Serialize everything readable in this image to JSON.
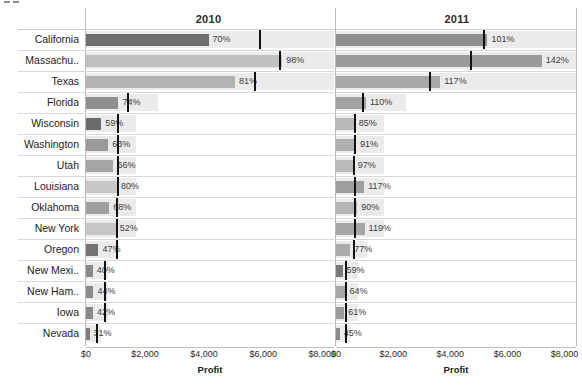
{
  "panels": [
    {
      "label": "2010"
    },
    {
      "label": "2011"
    }
  ],
  "axis": {
    "title": "Profit",
    "ticks": [
      "$0",
      "$2,000",
      "$4,000",
      "$6,000",
      "$8,000"
    ]
  },
  "colors": {
    "band": "#ebebeb",
    "reference_line": "#111111",
    "gridline": "#d8d8d8",
    "label_text": "#1c1c1c",
    "bar_dark": "#6e6e6e",
    "bar_light": "#c4c4c4"
  },
  "chart_data": {
    "type": "bar",
    "title": "",
    "xlabel": "Profit",
    "ylabel": "",
    "xlim": [
      0,
      8400
    ],
    "categories": [
      "California",
      "Massachu..",
      "Texas",
      "Florida",
      "Wisconsin",
      "Washington",
      "Utah",
      "Louisiana",
      "Oklahoma",
      "New York",
      "Oregon",
      "New Mexi..",
      "New Ham..",
      "Iowa",
      "Nevada"
    ],
    "panel_labels": [
      "2010",
      "2011"
    ],
    "series": [
      {
        "name": "2010",
        "values": [
          4150,
          6650,
          5050,
          1100,
          520,
          750,
          930,
          1050,
          790,
          1010,
          420,
          230,
          250,
          240,
          120
        ],
        "labels": [
          "70%",
          "98%",
          "81%",
          "74%",
          "59%",
          "63%",
          "66%",
          "80%",
          "68%",
          "52%",
          "47%",
          "40%",
          "44%",
          "42%",
          "31%"
        ],
        "reference_values": [
          5850,
          6550,
          5700,
          1380,
          1060,
          1060,
          1060,
          1060,
          1010,
          1010,
          1010,
          620,
          620,
          600,
          330
        ]
      },
      {
        "name": "2011",
        "values": [
          5300,
          7200,
          3650,
          1050,
          660,
          700,
          620,
          990,
          740,
          1000,
          500,
          230,
          330,
          290,
          130
        ],
        "labels": [
          "101%",
          "142%",
          "117%",
          "110%",
          "85%",
          "91%",
          "97%",
          "117%",
          "90%",
          "119%",
          "77%",
          "59%",
          "64%",
          "61%",
          "45%"
        ],
        "reference_values": [
          5150,
          4700,
          3250,
          920,
          620,
          620,
          600,
          620,
          620,
          620,
          580,
          330,
          330,
          330,
          330
        ]
      }
    ],
    "bar_shades": [
      "#6e6e6e",
      "#c0c0c0",
      "#b3b3b3",
      "#8f8f8f",
      "#6b6b6b",
      "#9a9a9a",
      "#a5a5a5",
      "#c8c8c8",
      "#a0a0a0",
      "#c6c6c6",
      "#747474",
      "#8a8a8a",
      "#8a8a8a",
      "#8a8a8a",
      "#7d7d7d"
    ],
    "bar_shades_2011": [
      "#8f8f8f",
      "#9b9b9b",
      "#a8a8a8",
      "#a2a2a2",
      "#b8b8b8",
      "#b0b0b0",
      "#bcbcbc",
      "#9e9e9e",
      "#b4b4b4",
      "#a6a6a6",
      "#aaaaaa",
      "#787878",
      "#a8a8a8",
      "#9c9c9c",
      "#8a8a8a"
    ],
    "band_extent": [
      8400,
      8400,
      8400,
      2450,
      1680,
      1680,
      1680,
      1680,
      1680,
      1680,
      1100,
      760,
      760,
      760,
      520
    ],
    "grid": true,
    "legend": "none"
  }
}
